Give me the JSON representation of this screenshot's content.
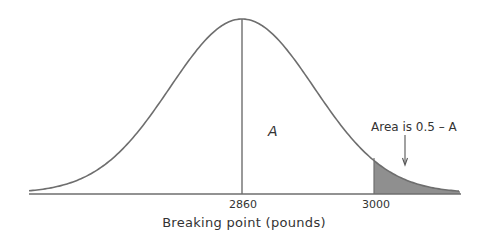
{
  "chart_data": {
    "type": "area",
    "title": "",
    "distribution": "normal",
    "mean": 2860,
    "xlabel": "Breaking point (pounds)",
    "ylabel": "",
    "x_ticks": [
      {
        "value": 2860,
        "label": "2860"
      },
      {
        "value": 3000,
        "label": "3000"
      }
    ],
    "regions": [
      {
        "name": "A",
        "from": 2860,
        "to": 3000,
        "label": "A",
        "shaded": false
      },
      {
        "name": "tail",
        "from": 3000,
        "to": null,
        "label": "Area is 0.5 – A",
        "shaded": true
      }
    ],
    "annotations": [
      {
        "text": "A",
        "position": "between mean and 3000"
      },
      {
        "text": "Area is 0.5 – A",
        "arrow_to": "shaded tail"
      }
    ],
    "colors": {
      "curve": "#6e6e6e",
      "shade": "#8f8f8f",
      "axis": "#6e6e6e"
    },
    "grid": false,
    "legend": null
  },
  "labels": {
    "tick_mean": "2860",
    "tick_3000": "3000",
    "xlabel": "Breaking point (pounds)",
    "region_a": "A",
    "annotation": "Area is 0.5 – A"
  }
}
